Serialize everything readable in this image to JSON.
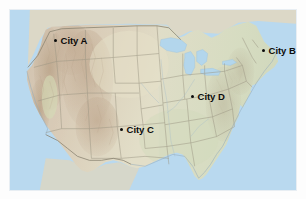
{
  "figure": {
    "type": "reference-map",
    "region": "Contiguous United States",
    "background_color": "#fdfdfd",
    "frame_border_color": "#e8eef3"
  },
  "map": {
    "ocean_color": "#b9d9ef",
    "lake_color": "#b3d6ec",
    "land_west_color": "#d9cdbb",
    "land_highland_color": "#cbb9a4",
    "land_east_color": "#d7dcc2",
    "land_central_color": "#e0dcc7",
    "state_border_color": "#9c9583",
    "country_border_color": "#8a8472",
    "coastline_color": "#8fa8b8",
    "marker_color": "#0a0a0a",
    "label_color": "#0b0b0b"
  },
  "cities": [
    {
      "label": "City A",
      "x": 53,
      "y": 36,
      "label_side": "right"
    },
    {
      "label": "City B",
      "x": 261,
      "y": 46,
      "label_side": "right"
    },
    {
      "label": "City C",
      "x": 119,
      "y": 125,
      "label_side": "right"
    },
    {
      "label": "City D",
      "x": 190,
      "y": 92,
      "label_side": "right"
    }
  ]
}
